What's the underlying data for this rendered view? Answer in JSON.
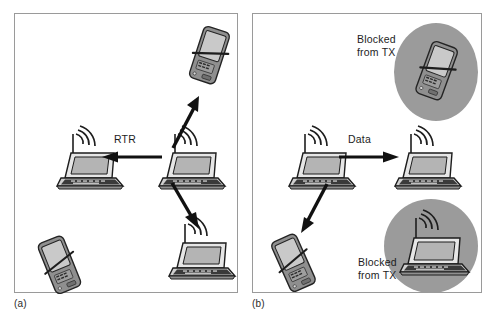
{
  "figure": {
    "background_color": "#ffffff",
    "border_color": "#9a9a9a",
    "shade_color": "#9b9b9b",
    "ink_color": "#1d1d1d"
  },
  "panels": [
    {
      "id": "a",
      "caption": "(a)",
      "flow_labels": [
        {
          "name": "rtr",
          "text": "RTR"
        }
      ],
      "nodes": [
        {
          "name": "laptop-left",
          "type": "laptop",
          "antenna": true,
          "shaded": false
        },
        {
          "name": "laptop-center",
          "type": "laptop",
          "antenna": true,
          "shaded": false
        },
        {
          "name": "laptop-lower-right",
          "type": "laptop",
          "antenna": true,
          "shaded": false
        },
        {
          "name": "pda-upper-right",
          "type": "pda",
          "antenna": false,
          "shaded": false
        },
        {
          "name": "pda-lower-left",
          "type": "pda",
          "antenna": false,
          "shaded": false
        }
      ],
      "arrows": [
        {
          "name": "arrow-rtr-left",
          "direction": "left"
        },
        {
          "name": "arrow-up-right",
          "direction": "up-right"
        },
        {
          "name": "arrow-down-right",
          "direction": "down-right"
        }
      ]
    },
    {
      "id": "b",
      "caption": "(b)",
      "flow_labels": [
        {
          "name": "data",
          "text": "Data"
        }
      ],
      "block_labels": [
        {
          "name": "blocked-top",
          "line1": "Blocked",
          "line2": "from TX"
        },
        {
          "name": "blocked-bottom",
          "line1": "Blocked",
          "line2": "from TX"
        }
      ],
      "nodes": [
        {
          "name": "laptop-sender",
          "type": "laptop",
          "antenna": true,
          "shaded": false
        },
        {
          "name": "laptop-receiver",
          "type": "laptop",
          "antenna": true,
          "shaded": false
        },
        {
          "name": "pda-upper-right",
          "type": "pda",
          "antenna": false,
          "shaded": true
        },
        {
          "name": "pda-lower-left",
          "type": "pda",
          "antenna": false,
          "shaded": false
        },
        {
          "name": "laptop-lower-right",
          "type": "laptop",
          "antenna": true,
          "shaded": true
        }
      ],
      "arrows": [
        {
          "name": "arrow-data-right",
          "direction": "right"
        },
        {
          "name": "arrow-down-left",
          "direction": "down-left"
        }
      ]
    }
  ]
}
